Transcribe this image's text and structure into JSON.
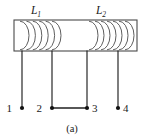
{
  "figure": {
    "caption": "(a)",
    "type": "circuit-diagram",
    "colors": {
      "line": "#1f1f1f",
      "core_stroke": "#4a4a4a",
      "winding_stroke": "#555555",
      "text": "#1a1a1a",
      "background": "#ffffff"
    },
    "core": {
      "x": 14,
      "y": 20,
      "width": 123,
      "height": 31
    },
    "coils": [
      {
        "id": "coil-l1",
        "label_base": "L",
        "label_sub": "1",
        "label_x": 36,
        "label_y": 14,
        "turns": 6,
        "start_x": 20,
        "spacing": 6.4,
        "arc_width": 9
      },
      {
        "id": "coil-l2",
        "label_base": "L",
        "label_sub": "2",
        "label_x": 101,
        "label_y": 14,
        "turns": 7,
        "start_x": 89,
        "spacing": 6.0,
        "arc_width": 9
      }
    ],
    "terminals": [
      {
        "id": "terminal-1",
        "label": "1",
        "lead_x": 22,
        "dot_x": 22,
        "dot_y": 108,
        "label_x": 12,
        "label_y": 112,
        "label_side": "left"
      },
      {
        "id": "terminal-2",
        "label": "2",
        "lead_x": 52,
        "dot_x": 52,
        "dot_y": 108,
        "label_x": 42,
        "label_y": 112,
        "label_side": "left"
      },
      {
        "id": "terminal-3",
        "label": "3",
        "lead_x": 87,
        "dot_x": 87,
        "dot_y": 108,
        "label_x": 92,
        "label_y": 112,
        "label_side": "right"
      },
      {
        "id": "terminal-4",
        "label": "4",
        "lead_x": 118,
        "dot_x": 118,
        "dot_y": 108,
        "label_x": 123,
        "label_y": 112,
        "label_side": "right"
      }
    ],
    "connection": {
      "id": "link-2-3",
      "from": "terminal-2",
      "to": "terminal-3",
      "x1": 52,
      "x2": 87,
      "y": 108
    },
    "caption_x": 72,
    "caption_y": 132
  }
}
